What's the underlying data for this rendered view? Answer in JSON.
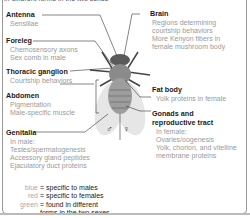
{
  "caption_fragment": "in different forms in the two sexes",
  "labels": {
    "antenna": {
      "title": "Antenna",
      "details": [
        "Sensillae"
      ]
    },
    "foreleg": {
      "title": "Foreleg",
      "details": [
        "Chemosensory axons",
        "Sex comb in male"
      ]
    },
    "thoracic_ganglion": {
      "title": "Thoracic ganglion",
      "details": [
        "Courtship behaviors"
      ]
    },
    "abdomen": {
      "title": "Abdomen",
      "details": [
        "Pigmentation",
        "Male-specific muscle"
      ]
    },
    "genitalia": {
      "title": "Genitalia",
      "details": [
        "In male:",
        "Testes/spermatogenesis",
        "Accessory gland peptides",
        "Ejaculatory duct proteins"
      ]
    },
    "brain": {
      "title": "Brain",
      "details": [
        "Regions determining",
        "courtship behaviors",
        "More Kenyon fibers in",
        "female mushroom body"
      ]
    },
    "fat_body": {
      "title": "Fat body",
      "details": [
        "Yolk proteins in female"
      ]
    },
    "gonads": {
      "title": "Gonads and",
      "title2": "reproductive tract",
      "details": [
        "In female:",
        "Ovaries/oogenesis",
        "Yolk, chorion, and vitelline",
        "membrane proteins"
      ]
    }
  },
  "sex_symbols": {
    "male": "♂",
    "female": "♀"
  },
  "legend": [
    {
      "key": "blue",
      "value": "= specific to males"
    },
    {
      "key": "red",
      "value": "= specific to females"
    },
    {
      "key": "green",
      "value": "= found in different"
    },
    {
      "key": "",
      "value": "forms in the two sexes"
    }
  ]
}
